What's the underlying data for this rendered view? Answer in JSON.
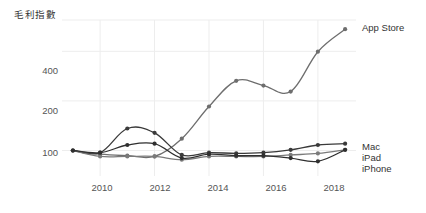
{
  "chart_data": {
    "type": "line",
    "title": "毛利指數",
    "xlabel": "",
    "ylabel": "",
    "yscale": "log",
    "ylim": [
      70,
      620
    ],
    "xlim": [
      2008.6,
      2019.4
    ],
    "grid": true,
    "legend_position": "right-inline",
    "ytick_labels": [
      "400",
      "200",
      "100"
    ],
    "ytick_values": [
      400,
      200,
      100
    ],
    "xtick_labels": [
      "2010",
      "2012",
      "2014",
      "2016",
      "2018"
    ],
    "xtick_values": [
      2010,
      2012,
      2014,
      2016,
      2018
    ],
    "x": [
      2009,
      2010,
      2011,
      2012,
      2013,
      2014,
      2015,
      2016,
      2017,
      2018,
      2019
    ],
    "series": [
      {
        "name": "App Store",
        "color": "#6e6e6e",
        "values": [
          100,
          95,
          93,
          92,
          118,
          185,
          265,
          248,
          228,
          398,
          545
        ]
      },
      {
        "name": "Mac",
        "color": "#3a3a3a",
        "values": [
          100,
          97,
          136,
          128,
          94,
          97,
          96,
          97,
          101,
          108,
          110
        ]
      },
      {
        "name": "iPad",
        "color": "#7a7a7a",
        "values": [
          100,
          92,
          92,
          92,
          88,
          92,
          92,
          92,
          94,
          96,
          101
        ]
      },
      {
        "name": "iPhone",
        "color": "#2f2f2f",
        "values": [
          100,
          97,
          108,
          110,
          90,
          95,
          93,
          93,
          90,
          86,
          101
        ]
      }
    ],
    "annotations": [
      {
        "text": "App Store",
        "x": 2019,
        "y": 545
      },
      {
        "text": "Mac",
        "x": 2019,
        "y": 110
      },
      {
        "text": "iPad",
        "x": 2019,
        "y": 101
      },
      {
        "text": "iPhone",
        "x": 2019,
        "y": 88
      }
    ]
  },
  "colors": {
    "grid": "#ededed",
    "text": "#444444",
    "background": "#ffffff"
  }
}
